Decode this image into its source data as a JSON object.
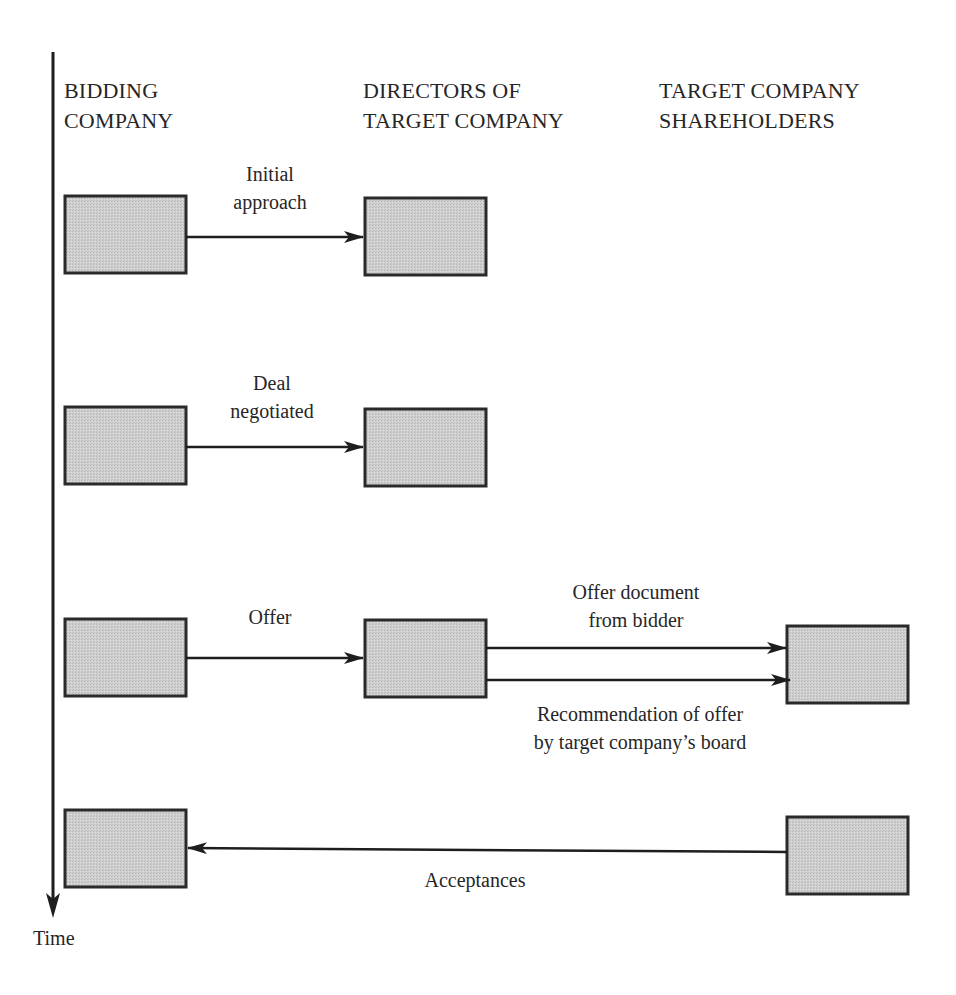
{
  "diagram": {
    "columns": [
      {
        "id": "bidder",
        "line1": "BIDDING",
        "line2": "COMPANY"
      },
      {
        "id": "directors",
        "line1": "DIRECTORS OF",
        "line2": "TARGET COMPANY"
      },
      {
        "id": "shareholders",
        "line1": "TARGET COMPANY",
        "line2": "SHAREHOLDERS"
      }
    ],
    "time_axis": {
      "label": "Time",
      "direction": "down"
    },
    "steps": [
      {
        "order": 1,
        "from": "bidder",
        "to": "directors",
        "label_line1": "Initial",
        "label_line2": "approach"
      },
      {
        "order": 2,
        "from": "bidder",
        "to": "directors",
        "label_line1": "Deal",
        "label_line2": "negotiated"
      },
      {
        "order": 3,
        "from": "bidder",
        "to": "directors",
        "label_line1": "Offer",
        "label_line2": ""
      },
      {
        "order": 3,
        "from": "directors",
        "to": "shareholders",
        "label_line1": "Offer document",
        "label_line2": "from bidder"
      },
      {
        "order": 3,
        "from": "directors",
        "to": "shareholders",
        "label_line1": "Recommendation of offer",
        "label_line2": "by target company’s board"
      },
      {
        "order": 4,
        "from": "shareholders",
        "to": "bidder",
        "label_line1": "Acceptances",
        "label_line2": ""
      }
    ],
    "colors": {
      "box_fill": "#c9c9c9",
      "box_stroke": "#2a2a2a",
      "line": "#1e1e1e",
      "text": "#262626"
    }
  }
}
